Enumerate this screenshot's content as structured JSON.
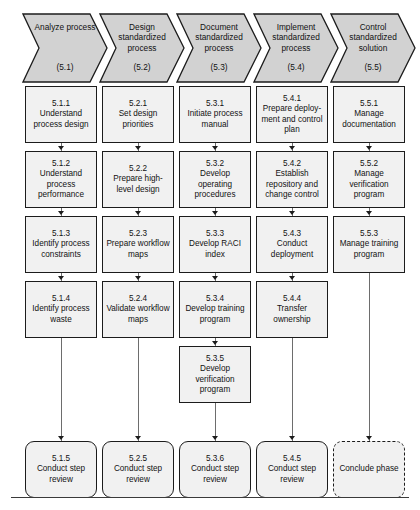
{
  "diagram": {
    "colors": {
      "header_fill": "#d2d2d2",
      "node_fill": "#f1f1f1",
      "border": "#1c1c1c",
      "connector": "#6d6d6d",
      "page_bg": "#ffffff"
    },
    "headers": [
      {
        "title": "Analyze process",
        "number": "(5.1)"
      },
      {
        "title": "Design standardized process",
        "number": "(5.2)"
      },
      {
        "title": "Document standardized process",
        "number": "(5.3)"
      },
      {
        "title": "Implement standardized process",
        "number": "(5.4)"
      },
      {
        "title": "Control standardized solution",
        "number": "(5.5)"
      }
    ],
    "columns": [
      {
        "name": "analyze-process",
        "nodes": [
          {
            "id": "5.1.1",
            "label": "5.1.1\nUnderstand process design",
            "row": 0,
            "shape": "rect"
          },
          {
            "id": "5.1.2",
            "label": "5.1.2\nUnderstand process performance",
            "row": 1,
            "shape": "rect"
          },
          {
            "id": "5.1.3",
            "label": "5.1.3\nIdentify process constraints",
            "row": 2,
            "shape": "rect"
          },
          {
            "id": "5.1.4",
            "label": "5.1.4\nIdentify process waste",
            "row": 3,
            "shape": "rect"
          },
          {
            "id": "5.1.5",
            "label": "5.1.5\nConduct step review",
            "row": 6,
            "shape": "round"
          }
        ]
      },
      {
        "name": "design-standardized-process",
        "nodes": [
          {
            "id": "5.2.1",
            "label": "5.2.1\nSet design priorities",
            "row": 0,
            "shape": "rect"
          },
          {
            "id": "5.2.2",
            "label": "5.2.2\nPrepare high-level design",
            "row": 1,
            "shape": "rect"
          },
          {
            "id": "5.2.3",
            "label": "5.2.3\nPrepare workflow maps",
            "row": 2,
            "shape": "rect"
          },
          {
            "id": "5.2.4",
            "label": "5.2.4\nValidate workflow maps",
            "row": 3,
            "shape": "rect"
          },
          {
            "id": "5.2.5",
            "label": "5.2.5\nConduct step review",
            "row": 6,
            "shape": "round"
          }
        ]
      },
      {
        "name": "document-standardized-process",
        "nodes": [
          {
            "id": "5.3.1",
            "label": "5.3.1\nInitiate process manual",
            "row": 0,
            "shape": "rect"
          },
          {
            "id": "5.3.2",
            "label": "5.3.2\nDevelop operating procedures",
            "row": 1,
            "shape": "rect"
          },
          {
            "id": "5.3.3",
            "label": "5.3.3\nDevelop RACI index",
            "row": 2,
            "shape": "rect"
          },
          {
            "id": "5.3.4",
            "label": "5.3.4\nDevelop training program",
            "row": 3,
            "shape": "rect"
          },
          {
            "id": "5.3.5",
            "label": "5.3.5\nDevelop verification program",
            "row": 4,
            "shape": "rect"
          },
          {
            "id": "5.3.6",
            "label": "5.3.6\nConduct step review",
            "row": 6,
            "shape": "round"
          }
        ]
      },
      {
        "name": "implement-standardized-process",
        "nodes": [
          {
            "id": "5.4.1",
            "label": "5.4.1\nPrepare deploy-ment and control plan",
            "row": 0,
            "shape": "rect"
          },
          {
            "id": "5.4.2",
            "label": "5.4.2\nEstablish repository and change control",
            "row": 1,
            "shape": "rect"
          },
          {
            "id": "5.4.3",
            "label": "5.4.3\nConduct deployment",
            "row": 2,
            "shape": "rect"
          },
          {
            "id": "5.4.4",
            "label": "5.4.4\nTransfer ownership",
            "row": 3,
            "shape": "rect"
          },
          {
            "id": "5.4.5",
            "label": "5.4.5\nConduct step review",
            "row": 6,
            "shape": "round"
          }
        ]
      },
      {
        "name": "control-standardized-solution",
        "nodes": [
          {
            "id": "5.5.1",
            "label": "5.5.1\nManage documentation",
            "row": 0,
            "shape": "rect"
          },
          {
            "id": "5.5.2",
            "label": "5.5.2\nManage verification program",
            "row": 1,
            "shape": "rect"
          },
          {
            "id": "5.5.3",
            "label": "5.5.3\nManage training program",
            "row": 2,
            "shape": "rect"
          },
          {
            "id": "conclude",
            "label": "Conclude phase",
            "row": 6,
            "shape": "round-dashed"
          }
        ]
      }
    ]
  }
}
